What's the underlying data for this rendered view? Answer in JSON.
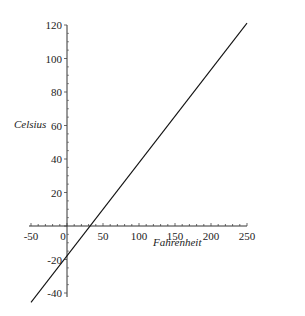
{
  "chart_data": {
    "type": "line",
    "title": "",
    "xlabel": "Fahrenheit",
    "ylabel": "Celsius",
    "xlim": [
      -50,
      250
    ],
    "ylim": [
      -45.6,
      121.1
    ],
    "x_ticks": [
      -50,
      0,
      50,
      100,
      150,
      200,
      250
    ],
    "y_ticks": [
      -40,
      -20,
      20,
      40,
      60,
      80,
      100,
      120
    ],
    "x_tick_labels": [
      "-50",
      "0",
      "50",
      "100",
      "150",
      "200",
      "250"
    ],
    "y_tick_labels": [
      "-40",
      "-20",
      "20",
      "40",
      "60",
      "80",
      "100",
      "120"
    ],
    "grid": false,
    "legend": "none",
    "series": [
      {
        "name": "Celsius vs Fahrenheit",
        "formula": "C = 5/9 (F - 32)",
        "x": [
          -50,
          250
        ],
        "y": [
          -45.56,
          121.11
        ],
        "color": "#111111"
      }
    ]
  }
}
